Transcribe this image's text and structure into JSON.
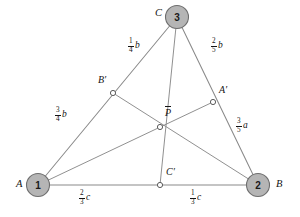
{
  "figure": {
    "type": "geometry-diagram",
    "canvas": {
      "width": 300,
      "height": 217
    },
    "colors": {
      "node_fill": "#b5b5b5",
      "node_stroke": "#6e6e6e",
      "line": "#8a8a8a",
      "marker_fill": "#ffffff",
      "marker_stroke": "#5c5c5c",
      "text": "#141414",
      "background": "#ffffff"
    }
  },
  "vertices": [
    {
      "id": "A",
      "label": "A",
      "number": "1",
      "x": 38,
      "y": 185,
      "label_x": 16,
      "label_y": 180
    },
    {
      "id": "B",
      "label": "B",
      "number": "2",
      "x": 258,
      "y": 185,
      "label_x": 276,
      "label_y": 180
    },
    {
      "id": "C",
      "label": "C",
      "number": "3",
      "x": 177,
      "y": 17,
      "label_x": 155,
      "label_y": 10
    }
  ],
  "points": [
    {
      "id": "Aprime",
      "label": "A′",
      "x": 213,
      "y": 102,
      "label_x": 219,
      "label_y": 89,
      "on_segment": "C-B"
    },
    {
      "id": "Bprime",
      "label": "B′",
      "x": 113,
      "y": 93,
      "label_x": 98,
      "label_y": 79,
      "on_segment": "C-A"
    },
    {
      "id": "Cprime",
      "label": "C′",
      "x": 160,
      "y": 185,
      "label_x": 166,
      "label_y": 171,
      "on_segment": "A-B"
    },
    {
      "id": "P",
      "label": "P",
      "overbar": true,
      "x": 160,
      "y": 127,
      "label_x": 165,
      "label_y": 110,
      "description": "cevian intersection point"
    }
  ],
  "edges": [
    {
      "id": "AB",
      "from": "A",
      "to": "B",
      "kind": "side"
    },
    {
      "id": "AC",
      "from": "A",
      "to": "C",
      "kind": "side"
    },
    {
      "id": "BC",
      "from": "B",
      "to": "C",
      "kind": "side"
    }
  ],
  "cevians": [
    {
      "id": "A-Aprime",
      "from": "A",
      "to": "Aprime"
    },
    {
      "id": "B-Bprime",
      "from": "B",
      "to": "Bprime"
    },
    {
      "id": "C-Cprime",
      "from": "C",
      "to": "Cprime"
    }
  ],
  "segment_labels": [
    {
      "id": "C-Bprime",
      "numerator": "1",
      "denominator": "4",
      "variable": "b",
      "x": 128,
      "y": 44,
      "segment": "C to B′"
    },
    {
      "id": "Bprime-A",
      "numerator": "3",
      "denominator": "4",
      "variable": "b",
      "x": 55,
      "y": 113,
      "segment": "B′ to A"
    },
    {
      "id": "C-Aprime",
      "numerator": "2",
      "denominator": "5",
      "variable": "b",
      "x": 211,
      "y": 44,
      "segment": "C to A′"
    },
    {
      "id": "Aprime-B",
      "numerator": "3",
      "denominator": "5",
      "variable": "a",
      "x": 236,
      "y": 124,
      "segment": "A′ to B"
    },
    {
      "id": "A-Cprime",
      "numerator": "2",
      "denominator": "3",
      "variable": "c",
      "x": 79,
      "y": 196,
      "segment": "A to C′"
    },
    {
      "id": "Cprime-B",
      "numerator": "1",
      "denominator": "3",
      "variable": "c",
      "x": 190,
      "y": 196,
      "segment": "C′ to B"
    }
  ]
}
